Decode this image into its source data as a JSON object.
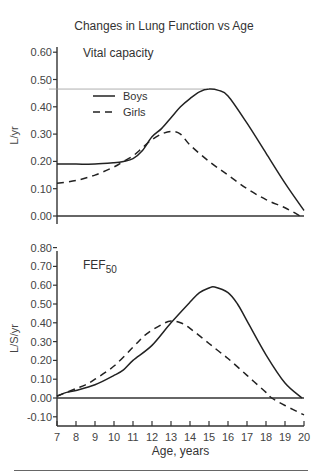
{
  "title": "Changes in Lung Function vs Age",
  "bottom_rule": true,
  "chart_data": [
    {
      "type": "line",
      "title": "Vital capacity",
      "panel_label": "Vital capacity",
      "xlabel": "Age, years",
      "ylabel": "L/yr",
      "xlim": [
        7,
        20
      ],
      "ylim": [
        0.0,
        0.6
      ],
      "yticks": [
        "0.00",
        "0.10",
        "0.20",
        "0.30",
        "0.40",
        "0.50",
        "0.60"
      ],
      "ytick_values": [
        0.0,
        0.1,
        0.2,
        0.3,
        0.4,
        0.5,
        0.6
      ],
      "reference_line": 0.465,
      "grid": false,
      "legend": {
        "position": "upper-left",
        "entries": [
          {
            "label": "Boys",
            "style": "solid"
          },
          {
            "label": "Girls",
            "style": "dashed"
          }
        ]
      },
      "series": [
        {
          "name": "Boys",
          "style": "solid",
          "x": [
            7,
            8,
            9,
            10,
            10.5,
            11,
            11.5,
            12,
            12.5,
            13,
            13.5,
            14,
            14.5,
            15,
            15.5,
            16,
            17,
            18,
            19,
            20
          ],
          "values": [
            0.19,
            0.19,
            0.19,
            0.195,
            0.2,
            0.21,
            0.24,
            0.29,
            0.32,
            0.36,
            0.4,
            0.43,
            0.455,
            0.465,
            0.46,
            0.44,
            0.34,
            0.23,
            0.12,
            0.02
          ]
        },
        {
          "name": "Girls",
          "style": "dashed",
          "x": [
            7,
            8,
            9,
            10,
            10.5,
            11,
            11.5,
            12,
            12.5,
            13,
            13.5,
            14,
            15,
            16,
            17,
            18,
            19,
            19.8
          ],
          "values": [
            0.12,
            0.13,
            0.15,
            0.18,
            0.2,
            0.22,
            0.25,
            0.28,
            0.3,
            0.31,
            0.3,
            0.26,
            0.2,
            0.15,
            0.1,
            0.06,
            0.03,
            0.0
          ]
        }
      ]
    },
    {
      "type": "line",
      "title": "FEF50",
      "panel_label": "FEF",
      "panel_label_sub": "50",
      "xlabel": "Age, years",
      "ylabel": "L/S/yr",
      "xlim": [
        7,
        20
      ],
      "ylim": [
        -0.1,
        0.8
      ],
      "xticks": [
        "7",
        "8",
        "9",
        "10",
        "11",
        "12",
        "13",
        "14",
        "15",
        "16",
        "17",
        "18",
        "19",
        "20"
      ],
      "yticks": [
        "-0.10",
        "0.00",
        "0.10",
        "0.20",
        "0.30",
        "0.40",
        "0.50",
        "0.60",
        "0.70",
        "0.80"
      ],
      "ytick_values": [
        -0.1,
        0.0,
        0.1,
        0.2,
        0.3,
        0.4,
        0.5,
        0.6,
        0.7,
        0.8
      ],
      "grid": false,
      "series": [
        {
          "name": "Boys",
          "style": "solid",
          "x": [
            7,
            7.5,
            8,
            9,
            10,
            10.5,
            11,
            12,
            13,
            14,
            14.5,
            15,
            15.3,
            16,
            16.5,
            17,
            18,
            19,
            19.9
          ],
          "values": [
            0.01,
            0.03,
            0.04,
            0.07,
            0.12,
            0.15,
            0.2,
            0.28,
            0.4,
            0.51,
            0.56,
            0.585,
            0.59,
            0.56,
            0.5,
            0.41,
            0.23,
            0.08,
            0.0
          ]
        },
        {
          "name": "Girls",
          "style": "dashed",
          "x": [
            7,
            8,
            8.5,
            9,
            10,
            11,
            11.7,
            12.5,
            13,
            13.5,
            14,
            15,
            15.5,
            16,
            17,
            18,
            18.3,
            19,
            20
          ],
          "values": [
            0.01,
            0.05,
            0.07,
            0.1,
            0.17,
            0.27,
            0.34,
            0.39,
            0.41,
            0.4,
            0.37,
            0.29,
            0.25,
            0.21,
            0.12,
            0.03,
            0.0,
            -0.04,
            -0.09
          ]
        }
      ]
    }
  ]
}
